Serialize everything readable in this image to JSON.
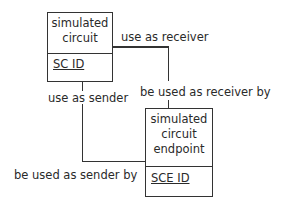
{
  "entities": [
    {
      "name_line1": "simulated",
      "name_line2": "circuit",
      "key": "SC ID"
    },
    {
      "name_line1": "simulated",
      "name_line2": "circuit",
      "name_line3": "endpoint",
      "key": "SCE ID"
    }
  ],
  "relationships": [
    {
      "label": "use as receiver"
    },
    {
      "label": "be used as receiver by"
    },
    {
      "label": "use as sender"
    },
    {
      "label": "be used as sender by"
    }
  ]
}
